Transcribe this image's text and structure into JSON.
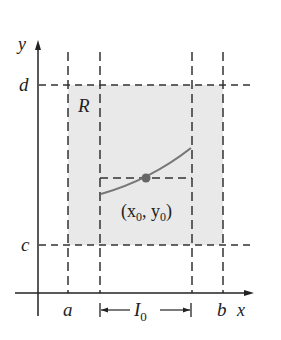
{
  "diagram": {
    "axes": {
      "x_label": "x",
      "y_label": "y"
    },
    "labels": {
      "a": "a",
      "b": "b",
      "c": "c",
      "d": "d",
      "region": "R",
      "interval": "I",
      "interval_sub": "0",
      "point_open": "(x",
      "point_sub1": "0",
      "point_mid": ", y",
      "point_sub2": "0",
      "point_close": ")"
    },
    "colors": {
      "region_fill": "#e9e9e9",
      "axis": "#222222",
      "dashed": "#333333",
      "curve": "#777777",
      "point": "#666666"
    }
  }
}
